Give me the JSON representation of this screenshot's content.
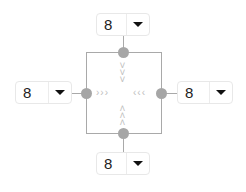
{
  "selectors": {
    "top": {
      "value": "8"
    },
    "left": {
      "value": "8"
    },
    "right": {
      "value": "8"
    },
    "bottom": {
      "value": "8"
    }
  },
  "arrows": {
    "from_left": "›››",
    "from_right": "‹‹‹",
    "from_top": [
      "˅",
      "˅",
      "˅"
    ],
    "from_bottom": [
      "˄",
      "˄",
      "˄"
    ]
  },
  "icons": {
    "dropdown": "caret-down-icon"
  }
}
